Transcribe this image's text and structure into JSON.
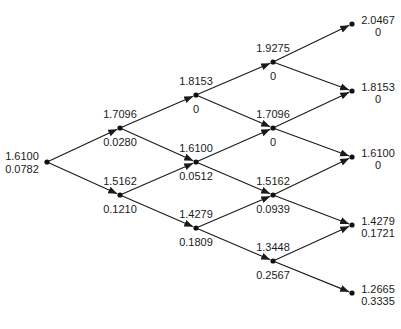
{
  "diagram": {
    "type": "binomial-tree",
    "steps": 4,
    "nodes": [
      {
        "id": "n0_0",
        "level": 0,
        "x": 47,
        "y": 162,
        "top": "1.6100",
        "bottom": "0.0782"
      },
      {
        "id": "n1_0",
        "level": 1,
        "x": 120,
        "y": 128,
        "top": "1.7096",
        "bottom": "0.0280"
      },
      {
        "id": "n1_1",
        "level": 1,
        "x": 120,
        "y": 195,
        "top": "1.5162",
        "bottom": "0.1210"
      },
      {
        "id": "n2_0",
        "level": 2,
        "x": 196,
        "y": 95,
        "top": "1.8153",
        "bottom": "0"
      },
      {
        "id": "n2_1",
        "level": 2,
        "x": 196,
        "y": 162,
        "top": "1.6100",
        "bottom": "0.0512"
      },
      {
        "id": "n2_2",
        "level": 2,
        "x": 196,
        "y": 228,
        "top": "1.4279",
        "bottom": "0.1809"
      },
      {
        "id": "n3_0",
        "level": 3,
        "x": 273,
        "y": 62,
        "top": "1.9275",
        "bottom": "0"
      },
      {
        "id": "n3_1",
        "level": 3,
        "x": 273,
        "y": 128,
        "top": "1.7096",
        "bottom": "0"
      },
      {
        "id": "n3_2",
        "level": 3,
        "x": 273,
        "y": 195,
        "top": "1.5162",
        "bottom": "0.0939"
      },
      {
        "id": "n3_3",
        "level": 3,
        "x": 273,
        "y": 261,
        "top": "1.3448",
        "bottom": "0.2567"
      },
      {
        "id": "n4_0",
        "level": 4,
        "x": 352,
        "y": 24,
        "top": "2.0467",
        "bottom": "0"
      },
      {
        "id": "n4_1",
        "level": 4,
        "x": 352,
        "y": 91,
        "top": "1.8153",
        "bottom": "0"
      },
      {
        "id": "n4_2",
        "level": 4,
        "x": 352,
        "y": 157,
        "top": "1.6100",
        "bottom": "0"
      },
      {
        "id": "n4_3",
        "level": 4,
        "x": 352,
        "y": 225,
        "top": "1.4279",
        "bottom": "0.1721"
      },
      {
        "id": "n4_4",
        "level": 4,
        "x": 352,
        "y": 293,
        "top": "1.2665",
        "bottom": "0.3335"
      }
    ],
    "edges": [
      [
        "n0_0",
        "n1_0"
      ],
      [
        "n0_0",
        "n1_1"
      ],
      [
        "n1_0",
        "n2_0"
      ],
      [
        "n1_0",
        "n2_1"
      ],
      [
        "n1_1",
        "n2_1"
      ],
      [
        "n1_1",
        "n2_2"
      ],
      [
        "n2_0",
        "n3_0"
      ],
      [
        "n2_0",
        "n3_1"
      ],
      [
        "n2_1",
        "n3_1"
      ],
      [
        "n2_1",
        "n3_2"
      ],
      [
        "n2_2",
        "n3_2"
      ],
      [
        "n2_2",
        "n3_3"
      ],
      [
        "n3_0",
        "n4_0"
      ],
      [
        "n3_0",
        "n4_1"
      ],
      [
        "n3_1",
        "n4_1"
      ],
      [
        "n3_1",
        "n4_2"
      ],
      [
        "n3_2",
        "n4_2"
      ],
      [
        "n3_2",
        "n4_3"
      ],
      [
        "n3_3",
        "n4_3"
      ],
      [
        "n3_3",
        "n4_4"
      ]
    ],
    "colors": {
      "line": "#1a1a1a",
      "node": "#111111",
      "text": "#1a1a1a",
      "background": "#ffffff"
    }
  }
}
